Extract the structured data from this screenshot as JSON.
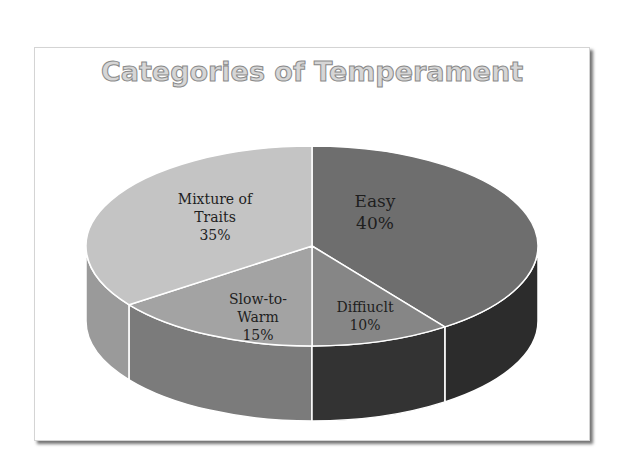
{
  "chart_data": {
    "type": "pie",
    "style": "3d",
    "title": "Categories of Temperament",
    "categories": [
      "Easy",
      "Diffiuclt",
      "Slow-to-Warm",
      "Mixture of Traits"
    ],
    "values": [
      40,
      10,
      15,
      35
    ],
    "labels": [
      "Easy 40%",
      "Diffiuclt 10%",
      "Slow-to-Warm 15%",
      "Mixture of Traits 35%"
    ],
    "colors_top": [
      "#6e6e6e",
      "#868686",
      "#a3a3a3",
      "#c4c4c4"
    ],
    "colors_side": [
      "#2c2c2c",
      "#333333",
      "#7b7b7b",
      "#9a9a9a"
    ],
    "legend": "none",
    "data_labels": "inside"
  },
  "slices": [
    {
      "name": "Easy",
      "pct": "40%"
    },
    {
      "name": "Diffiuclt",
      "pct": "10%"
    },
    {
      "name_line1": "Slow-to-",
      "name_line2": "Warm",
      "pct": "15%"
    },
    {
      "name_line1": "Mixture of",
      "name_line2": "Traits",
      "pct": "35%"
    }
  ]
}
